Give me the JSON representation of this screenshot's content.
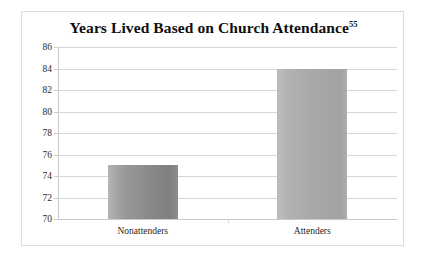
{
  "chart_data": {
    "type": "bar",
    "title": "Years Lived Based on Church Attendance",
    "title_superscript": "55",
    "categories": [
      "Nonattenders",
      "Attenders"
    ],
    "values": [
      75,
      84
    ],
    "series": [
      {
        "name": "Years Lived",
        "values": [
          75,
          84
        ]
      }
    ],
    "xlabel": "",
    "ylabel": "",
    "ylim": [
      70,
      86
    ],
    "yticks": [
      86,
      84,
      82,
      80,
      78,
      76,
      74,
      72,
      70
    ],
    "ytick_labels": [
      "86",
      "84",
      "82",
      "80",
      "78",
      "76",
      "74",
      "72",
      "70"
    ],
    "grid": true,
    "legend": false,
    "legend_position": "none",
    "colors": {
      "bar_nonattenders": "#8b8b8b",
      "bar_attenders": "#a8a8a8",
      "gridline": "#d6d6d6",
      "axis": "#c9c9c9",
      "border": "#dcdcdc",
      "background": "#ffffff",
      "title_text": "#0f0f0f",
      "tick_text": "#2b2b2b"
    }
  }
}
